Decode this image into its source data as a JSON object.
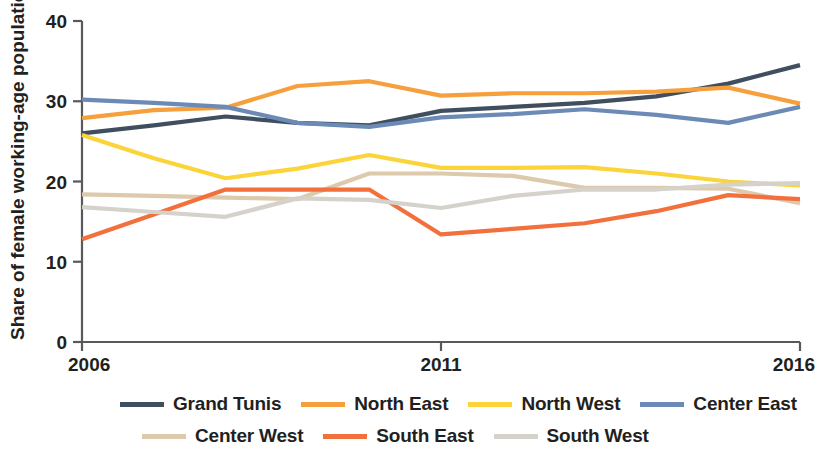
{
  "chart_data": {
    "type": "line",
    "title": "",
    "xlabel": "",
    "ylabel": "Share of female working-age population (%)",
    "x": [
      2006,
      2007,
      2008,
      2009,
      2010,
      2011,
      2012,
      2013,
      2014,
      2015,
      2016
    ],
    "xticks": [
      "2006",
      "2011",
      "2016"
    ],
    "xtick_values": [
      2006,
      2011,
      2016
    ],
    "yticks": [
      "0",
      "10",
      "20",
      "30",
      "40"
    ],
    "ytick_values": [
      0,
      10,
      20,
      30,
      40
    ],
    "ylim": [
      0,
      40
    ],
    "xlim": [
      2006,
      2016
    ],
    "grid": false,
    "legend_position": "bottom",
    "series": [
      {
        "name": "Grand Tunis",
        "color": "#3f4f60",
        "values": [
          26.0,
          27.0,
          28.1,
          27.3,
          27.0,
          28.8,
          29.3,
          29.8,
          30.6,
          32.2,
          34.5
        ]
      },
      {
        "name": "North East",
        "color": "#f5a03c",
        "values": [
          27.9,
          28.9,
          29.2,
          31.9,
          32.5,
          30.7,
          31.0,
          31.0,
          31.2,
          31.7,
          29.7
        ]
      },
      {
        "name": "North West",
        "color": "#fbd43a",
        "values": [
          25.8,
          22.9,
          20.4,
          21.6,
          23.3,
          21.7,
          21.7,
          21.8,
          21.0,
          20.0,
          19.5
        ]
      },
      {
        "name": "Center East",
        "color": "#6b8ab5",
        "values": [
          30.2,
          29.8,
          29.3,
          27.3,
          26.8,
          28.0,
          28.4,
          29.0,
          28.3,
          27.3,
          29.3
        ]
      },
      {
        "name": "Center West",
        "color": "#ddc9ab",
        "values": [
          18.4,
          18.2,
          18.0,
          17.8,
          21.0,
          21.0,
          20.7,
          19.2,
          19.2,
          19.1,
          17.3
        ]
      },
      {
        "name": "South East",
        "color": "#f2703c",
        "values": [
          12.8,
          15.9,
          19.0,
          19.0,
          19.0,
          13.4,
          14.1,
          14.8,
          16.3,
          18.3,
          17.8
        ]
      },
      {
        "name": "South West",
        "color": "#d5d2cc",
        "values": [
          16.8,
          16.2,
          15.6,
          17.9,
          17.7,
          16.7,
          18.2,
          19.0,
          19.0,
          19.6,
          19.8
        ]
      }
    ]
  },
  "axes": {
    "y_axis_title": "Share of female working-age population (%)",
    "y_ticks": [
      "40",
      "30",
      "20",
      "10",
      "0"
    ],
    "x_ticks": [
      "2006",
      "2011",
      "2016"
    ]
  },
  "legend": {
    "row1": [
      {
        "label": "Grand Tunis",
        "color": "#3f4f60"
      },
      {
        "label": "North East",
        "color": "#f5a03c"
      },
      {
        "label": "North West",
        "color": "#fbd43a"
      },
      {
        "label": "Center East",
        "color": "#6b8ab5"
      }
    ],
    "row2": [
      {
        "label": "Center West",
        "color": "#ddc9ab"
      },
      {
        "label": "South East",
        "color": "#f2703c"
      },
      {
        "label": "South West",
        "color": "#d5d2cc"
      }
    ]
  }
}
